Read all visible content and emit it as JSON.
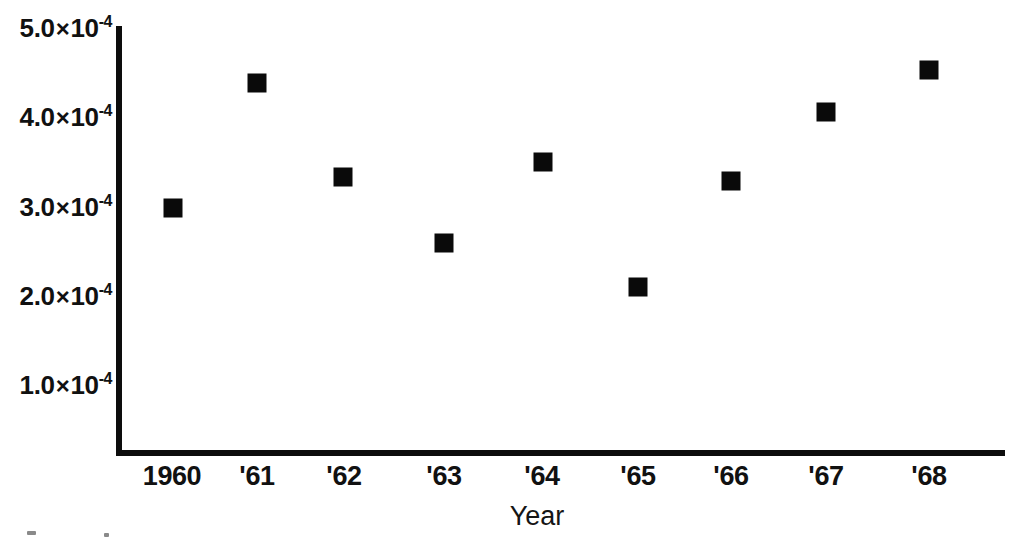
{
  "chart_data": {
    "type": "scatter",
    "title": "",
    "xlabel": "Year",
    "ylabel": "",
    "grid": false,
    "legend": null,
    "marker_style": "filled-square",
    "marker_color": "#0a0a0a",
    "x": [
      1960,
      1961,
      1962,
      1963,
      1964,
      1965,
      1966,
      1967,
      1968
    ],
    "categories": [
      "1960",
      "'61",
      "'62",
      "'63",
      "'64",
      "'65",
      "'66",
      "'67",
      "'68"
    ],
    "values": [
      0.000298,
      0.000438,
      0.000333,
      0.000259,
      0.00035,
      0.00021,
      0.000329,
      0.000406,
      0.000453
    ],
    "ylim": [
      0.0,
      0.00053
    ],
    "xlim": [
      1959.4,
      1969.2
    ],
    "ytick_values": [
      0.0005,
      0.0004,
      0.0003,
      0.0002,
      0.0001
    ],
    "ytick_labels": [
      {
        "mantissa": "5.0",
        "times": "×",
        "base": "10",
        "exp": "-4"
      },
      {
        "mantissa": "4.0",
        "times": "×",
        "base": "10",
        "exp": "-4"
      },
      {
        "mantissa": "3.0",
        "times": "×",
        "base": "10",
        "exp": "-4"
      },
      {
        "mantissa": "2.0",
        "times": "×",
        "base": "10",
        "exp": "-4"
      },
      {
        "mantissa": "1.0",
        "times": "×",
        "base": "10",
        "exp": "-4"
      }
    ],
    "xtick_labels": [
      "1960",
      "'61",
      "'62",
      "'63",
      "'64",
      "'65",
      "'66",
      "'67",
      "'68"
    ],
    "points": [
      {
        "label": "1960",
        "value": 0.000298,
        "px": 173,
        "py": 208
      },
      {
        "label": "'61",
        "value": 0.000438,
        "px": 257,
        "py": 83
      },
      {
        "label": "'62",
        "value": 0.000333,
        "px": 343,
        "py": 177
      },
      {
        "label": "'63",
        "value": 0.000259,
        "px": 444,
        "py": 243
      },
      {
        "label": "'64",
        "value": 0.00035,
        "px": 543,
        "py": 162
      },
      {
        "label": "'65",
        "value": 0.00021,
        "px": 638,
        "py": 287
      },
      {
        "label": "'66",
        "value": 0.000329,
        "px": 731,
        "py": 181
      },
      {
        "label": "'67",
        "value": 0.000406,
        "px": 826,
        "py": 112
      },
      {
        "label": "'68",
        "value": 0.000453,
        "px": 929,
        "py": 70
      }
    ],
    "ytick_pixels": [
      28,
      117,
      207,
      296,
      385
    ],
    "xtick_pixels": [
      172,
      257,
      344,
      444,
      542,
      638,
      731,
      826,
      929
    ],
    "axis_color": "#0d0d0d",
    "background_color": "#ffffff"
  },
  "axis_titles": {
    "x": "Year"
  }
}
